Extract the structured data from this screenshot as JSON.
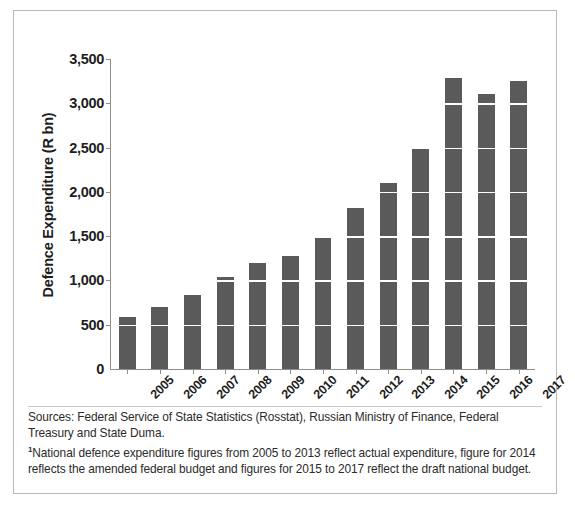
{
  "chart_data": {
    "type": "bar",
    "title": "",
    "xlabel": "",
    "ylabel": "Defence Expenditure (R bn)",
    "categories": [
      "2005",
      "2006",
      "2007",
      "2008",
      "2009",
      "2010",
      "2011",
      "2012",
      "2013",
      "2014",
      "2015",
      "2016",
      "2017"
    ],
    "values": [
      590,
      700,
      840,
      1040,
      1200,
      1280,
      1500,
      1820,
      2100,
      2480,
      3290,
      3100,
      3250
    ],
    "ylim": [
      0,
      3500
    ],
    "ytick_values": [
      0,
      500,
      1000,
      1500,
      2000,
      2500,
      3000,
      3500
    ],
    "ytick_labels": [
      "0",
      "500",
      "1,000",
      "1,500",
      "2,000",
      "2,500",
      "3,000",
      "3,500"
    ],
    "grid": "horizontal",
    "legend": "none",
    "series": [
      {
        "name": "Defence Expenditure (R bn)",
        "values": [
          590,
          700,
          840,
          1040,
          1200,
          1280,
          1500,
          1820,
          2100,
          2480,
          3290,
          3100,
          3250
        ]
      }
    ],
    "bar_color": "#5a5a5a",
    "gridline_color": "#ffffff",
    "axis_color": "#8e8e8e"
  },
  "footnote": {
    "sources": "Sources: Federal Service of State Statistics (Rosstat), Russian Ministry of Finance, Federal Treasury and State Duma.",
    "marker": "1",
    "note": "National defence expenditure figures from 2005 to 2013 reflect actual expenditure, figure for 2014 reflects the amended federal budget and figures for 2015 to 2017 reflect the draft national budget."
  },
  "colors": {
    "border": "#b8b8b8",
    "text": "#1d1d1d",
    "bar": "#5a5a5a"
  }
}
